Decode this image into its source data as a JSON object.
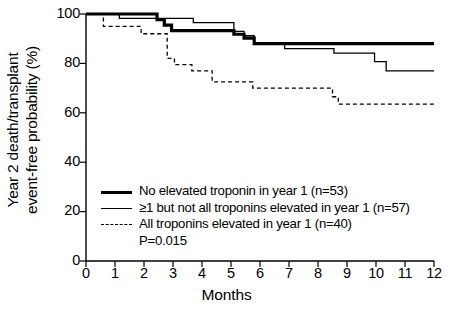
{
  "chart_data": {
    "type": "line",
    "subtype": "kaplan-meier-step",
    "title": "",
    "xlabel": "Months",
    "ylabel": "Year 2 death/transplant event-free probability (%)",
    "ylabel_line1": "Year 2 death/transplant",
    "ylabel_line2": "event-free probability (%)",
    "xlim": [
      0,
      12
    ],
    "ylim": [
      0,
      100
    ],
    "xticks": [
      0,
      1,
      2,
      3,
      4,
      5,
      6,
      7,
      8,
      9,
      10,
      11,
      12
    ],
    "xtick_labels": [
      "0",
      "1",
      "2",
      "3",
      "4",
      "5",
      "6",
      "7",
      "8",
      "9",
      "10",
      "11",
      "12"
    ],
    "yticks": [
      0,
      20,
      40,
      60,
      80,
      100
    ],
    "ytick_labels": [
      "0",
      "20",
      "40",
      "60",
      "80",
      "100"
    ],
    "grid": false,
    "legend_position": "inside-lower-left",
    "annotations": [
      {
        "name": "p-value",
        "text": "P=0.015"
      }
    ],
    "series": [
      {
        "name": "No elevated troponin in year 1 (n=53)",
        "legend_label": "No elevated troponin in year 1 (n=53)",
        "n": 53,
        "style": "solid-bold",
        "color": "#000000",
        "linewidth": 3.2,
        "final_value": 88.0,
        "x": [
          0.0,
          2.45,
          2.45,
          2.7,
          2.7,
          2.95,
          2.95,
          3.6,
          3.6,
          5.1,
          5.1,
          5.45,
          5.45,
          5.8,
          5.8,
          12.0
        ],
        "y": [
          100.0,
          100.0,
          97.7,
          97.7,
          95.5,
          95.5,
          93.3,
          93.3,
          93.3,
          93.3,
          91.8,
          91.8,
          90.2,
          90.2,
          88.0,
          88.0
        ],
        "steps": [
          {
            "month": 0.0,
            "value": 100.0
          },
          {
            "month": 2.45,
            "value": 97.7
          },
          {
            "month": 2.7,
            "value": 95.5
          },
          {
            "month": 2.95,
            "value": 93.3
          },
          {
            "month": 5.1,
            "value": 91.8
          },
          {
            "month": 5.45,
            "value": 90.2
          },
          {
            "month": 5.8,
            "value": 88.0
          },
          {
            "month": 12.0,
            "value": 88.0
          }
        ]
      },
      {
        "name": "≥1 but not all troponins elevated in year 1 (n=57)",
        "legend_label": "≥1 but not all troponins elevated in year 1 (n=57)",
        "n": 57,
        "style": "solid-thin",
        "color": "#000000",
        "linewidth": 1.3,
        "final_value": 77.0,
        "x": [
          0.0,
          1.15,
          1.15,
          3.7,
          3.7,
          5.1,
          5.1,
          5.45,
          5.45,
          5.8,
          5.8,
          6.85,
          6.85,
          8.55,
          8.55,
          9.95,
          9.95,
          10.35,
          10.35,
          12.0
        ],
        "y": [
          100.0,
          100.0,
          98.2,
          98.2,
          96.5,
          96.5,
          93.0,
          93.0,
          91.2,
          91.2,
          87.7,
          87.7,
          86.0,
          86.0,
          84.2,
          84.2,
          80.7,
          80.7,
          77.0,
          77.0
        ],
        "steps": [
          {
            "month": 0.0,
            "value": 100.0
          },
          {
            "month": 1.15,
            "value": 98.2
          },
          {
            "month": 3.7,
            "value": 96.5
          },
          {
            "month": 5.1,
            "value": 93.0
          },
          {
            "month": 5.45,
            "value": 91.2
          },
          {
            "month": 5.8,
            "value": 87.7
          },
          {
            "month": 6.85,
            "value": 86.0
          },
          {
            "month": 8.55,
            "value": 84.2
          },
          {
            "month": 9.95,
            "value": 80.7
          },
          {
            "month": 10.35,
            "value": 77.0
          },
          {
            "month": 12.0,
            "value": 77.0
          }
        ]
      },
      {
        "name": "All troponins elevated in year 1 (n=40)",
        "legend_label": "All troponins elevated in year 1 (n=40)",
        "n": 40,
        "style": "dashed",
        "color": "#000000",
        "linewidth": 1.3,
        "final_value": 63.5,
        "x": [
          0.0,
          0.6,
          0.6,
          1.9,
          1.9,
          2.8,
          2.8,
          3.05,
          3.05,
          3.65,
          3.65,
          4.35,
          4.35,
          5.75,
          5.75,
          8.5,
          8.5,
          8.7,
          8.7,
          12.0
        ],
        "y": [
          100.0,
          100.0,
          95.0,
          95.0,
          92.0,
          92.0,
          82.0,
          82.0,
          79.5,
          79.5,
          77.0,
          77.0,
          72.5,
          72.5,
          70.0,
          70.0,
          66.5,
          66.5,
          63.5,
          63.5
        ],
        "steps": [
          {
            "month": 0.0,
            "value": 100.0
          },
          {
            "month": 0.6,
            "value": 95.0
          },
          {
            "month": 1.9,
            "value": 92.0
          },
          {
            "month": 2.8,
            "value": 82.0
          },
          {
            "month": 3.05,
            "value": 79.5
          },
          {
            "month": 3.65,
            "value": 77.0
          },
          {
            "month": 4.35,
            "value": 72.5
          },
          {
            "month": 5.75,
            "value": 70.0
          },
          {
            "month": 8.5,
            "value": 66.5
          },
          {
            "month": 8.7,
            "value": 63.5
          },
          {
            "month": 12.0,
            "value": 63.5
          }
        ]
      }
    ]
  },
  "legend": {
    "items": [
      {
        "label": "No elevated troponin in year 1 (n=53)",
        "style": "solid-bold"
      },
      {
        "label": "≥1 but not all troponins elevated in year 1 (n=57)",
        "style": "solid-thin"
      },
      {
        "label": "All troponins elevated in year 1 (n=40)",
        "style": "dashed"
      }
    ],
    "pvalue": "P=0.015"
  },
  "colors": {
    "axis": "#000000",
    "background": "#ffffff",
    "series": "#000000"
  }
}
